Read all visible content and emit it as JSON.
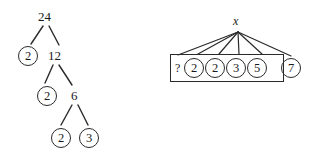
{
  "figure": {
    "stroke_color": "#2a2a2a",
    "text_color": "#1a1a1a",
    "background": "#ffffff"
  },
  "factor_tree": {
    "name": "factor-tree-of-24",
    "root": {
      "label": "24",
      "circled": false,
      "x": 38,
      "y": 10
    },
    "nodes": [
      {
        "id": "root",
        "label": "24",
        "circled": false,
        "x": 38,
        "y": 10
      },
      {
        "id": "l1a",
        "label": "2",
        "circled": true,
        "x": 18,
        "y": 46
      },
      {
        "id": "l1b",
        "label": "12",
        "circled": false,
        "x": 48,
        "y": 49
      },
      {
        "id": "l2a",
        "label": "2",
        "circled": true,
        "x": 37,
        "y": 86
      },
      {
        "id": "l2b",
        "label": "6",
        "circled": false,
        "x": 71,
        "y": 89
      },
      {
        "id": "l3a",
        "label": "2",
        "circled": true,
        "x": 51,
        "y": 128
      },
      {
        "id": "l3b",
        "label": "3",
        "circled": true,
        "x": 79,
        "y": 128
      }
    ],
    "edges": [
      {
        "from": "24",
        "to": "2",
        "x1": 43,
        "y1": 26,
        "x2": 31,
        "y2": 44
      },
      {
        "from": "24",
        "to": "12",
        "x1": 49,
        "y1": 26,
        "x2": 59,
        "y2": 45
      },
      {
        "from": "12",
        "to": "2",
        "x1": 53,
        "y1": 65,
        "x2": 45,
        "y2": 83
      },
      {
        "from": "12",
        "to": "6",
        "x1": 59,
        "y1": 65,
        "x2": 72,
        "y2": 85
      },
      {
        "from": "6",
        "to": "2",
        "x1": 72,
        "y1": 105,
        "x2": 61,
        "y2": 125
      },
      {
        "from": "6",
        "to": "3",
        "x1": 78,
        "y1": 105,
        "x2": 88,
        "y2": 125
      }
    ]
  },
  "fan_diagram": {
    "name": "fan-diagram-with-box",
    "variable_label": "x",
    "variable_pos": {
      "x": 233,
      "y": 14
    },
    "apex": {
      "x": 238,
      "y": 32
    },
    "box": {
      "x": 170,
      "y": 54,
      "width": 114,
      "height": 28
    },
    "unknown_marker": "?",
    "unknown_pos": {
      "x": 175,
      "y": 62
    },
    "inside_values": [
      "2",
      "2",
      "3",
      "5"
    ],
    "outside_values": [
      "7"
    ],
    "circles": [
      {
        "label": "2",
        "x": 184,
        "y": 58,
        "inside_box": true
      },
      {
        "label": "2",
        "x": 205,
        "y": 58,
        "inside_box": true
      },
      {
        "label": "3",
        "x": 226,
        "y": 58,
        "inside_box": true
      },
      {
        "label": "5",
        "x": 247,
        "y": 58,
        "inside_box": true
      },
      {
        "label": "7",
        "x": 281,
        "y": 58,
        "inside_box": false
      }
    ],
    "fan_lines": [
      {
        "x1": 238,
        "y1": 32,
        "x2": 178,
        "y2": 55
      },
      {
        "x1": 238,
        "y1": 32,
        "x2": 198,
        "y2": 54
      },
      {
        "x1": 238,
        "y1": 32,
        "x2": 219,
        "y2": 54
      },
      {
        "x1": 238,
        "y1": 32,
        "x2": 239,
        "y2": 54
      },
      {
        "x1": 238,
        "y1": 32,
        "x2": 262,
        "y2": 54
      },
      {
        "x1": 238,
        "y1": 32,
        "x2": 291,
        "y2": 56
      }
    ]
  }
}
